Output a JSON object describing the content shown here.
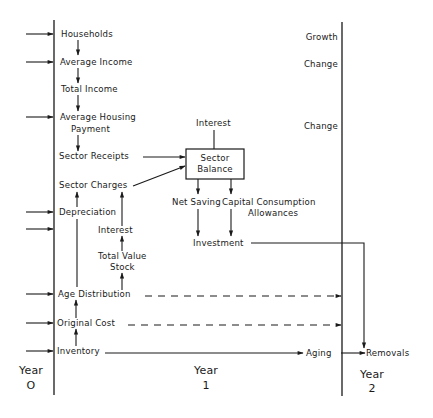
{
  "diagram": {
    "type": "flow-diagram",
    "axis_labels": {
      "year0": {
        "label": "Year",
        "value": "O"
      },
      "year1": {
        "label": "Year",
        "value": "1"
      },
      "year2": {
        "label": "Year",
        "value": "2"
      }
    },
    "left_column": {
      "households": "Households",
      "average_income": "Average Income",
      "total_income": "Total Income",
      "average_housing_payment_line1": "Average Housing",
      "average_housing_payment_line2": "Payment",
      "sector_receipts": "Sector Receipts",
      "sector_charges": "Sector Charges",
      "depreciation": "Depreciation",
      "interest": "Interest",
      "total_value_stock_line1": "Total Value",
      "total_value_stock_line2": "Stock",
      "age_distribution": "Age Distribution",
      "original_cost": "Original Cost",
      "inventory": "Inventory"
    },
    "center": {
      "interest_top": "Interest",
      "sector_balance_line1": "Sector",
      "sector_balance_line2": "Balance",
      "net_saving": "Net Saving",
      "capital_consumption_line1": "Capital Consumption",
      "capital_consumption_line2": "Allowances",
      "investment": "Investment",
      "aging": "Aging"
    },
    "right_column": {
      "growth": "Growth",
      "change_1": "Change",
      "change_2": "Change",
      "removals": "Removals"
    },
    "colors": {
      "line": "#1a1a1a",
      "background": "#ffffff"
    }
  }
}
